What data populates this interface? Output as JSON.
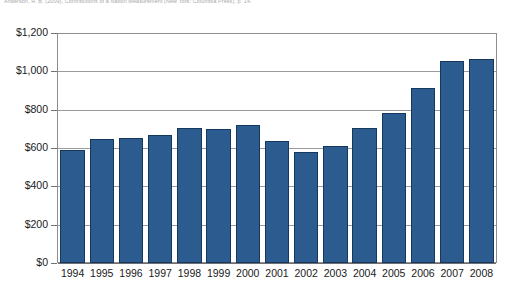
{
  "citation": {
    "text": "Anderson, R. B. (2009), Contributions of a Nation Measurement (New York: Columbia Press), p. 14."
  },
  "chart_data": {
    "type": "bar",
    "title": "",
    "xlabel": "",
    "ylabel": "",
    "categories": [
      "1994",
      "1995",
      "1996",
      "1997",
      "1998",
      "1999",
      "2000",
      "2001",
      "2002",
      "2003",
      "2004",
      "2005",
      "2006",
      "2007",
      "2008"
    ],
    "values": [
      590,
      645,
      650,
      668,
      703,
      700,
      718,
      635,
      580,
      608,
      703,
      785,
      913,
      1055,
      1065
    ],
    "ylim": [
      0,
      1200
    ],
    "ytick_values": [
      0,
      200,
      400,
      600,
      800,
      1000,
      1200
    ],
    "ytick_labels": [
      "$0",
      "$200",
      "$400",
      "$600",
      "$800",
      "$1,000",
      "$1,200"
    ],
    "grid": true,
    "legend": false,
    "bar_color": "#2c5c8f",
    "bar_edge_color": "#16385c",
    "gridline_color": "#9a9a9f"
  }
}
